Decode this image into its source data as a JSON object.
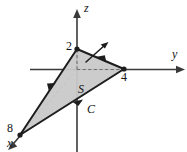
{
  "figure": {
    "kind": "3d-coordinate-diagram",
    "background_color": "#ffffff",
    "surface_fill_color": "#c9c9c9",
    "edge_color": "#1d1d1d",
    "axis_color": "#3a3a3a",
    "dashed_color": "#6e6e6e"
  },
  "axes": [
    {
      "name": "z-axis",
      "label": "z",
      "direction": "up",
      "has_arrow": true
    },
    {
      "name": "y-axis",
      "label": "y",
      "direction": "right",
      "has_arrow": true
    },
    {
      "name": "x-axis",
      "label": "x",
      "direction": "down-left",
      "has_arrow": true,
      "style": "dashed-behind-surface"
    }
  ],
  "intercepts": [
    {
      "name": "z-intercept",
      "label": "2",
      "axis": "z"
    },
    {
      "name": "y-intercept",
      "label": "4",
      "axis": "y"
    },
    {
      "name": "x-intercept",
      "label": "8",
      "axis": "x"
    }
  ],
  "annotations": [
    {
      "name": "surface-label",
      "label": "S",
      "meaning": "surface region"
    },
    {
      "name": "curve-label",
      "label": "C",
      "meaning": "oriented boundary curve"
    }
  ],
  "normal_vector": {
    "name": "normal-vector",
    "visible": true,
    "direction": "up-right",
    "label": ""
  },
  "orientation_arrows": {
    "count": 3,
    "description": "arrowheads on each triangle edge indicating counterclockwise orientation of C"
  },
  "geometry": {
    "vertex_z": {
      "x": 77,
      "y": 49
    },
    "vertex_y": {
      "x": 124,
      "y": 69
    },
    "vertex_x": {
      "x": 20,
      "y": 135
    },
    "origin": {
      "x": 77,
      "y": 69
    }
  }
}
